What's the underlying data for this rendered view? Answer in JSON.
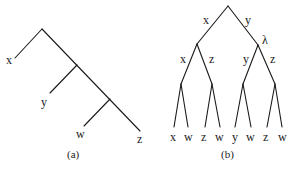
{
  "diagram_a": {
    "caption": "(a)",
    "leaves": [
      "x",
      "y",
      "w",
      "z"
    ],
    "structure": "caterpillar tree: x branches first, then y, then w and z"
  },
  "diagram_b": {
    "caption": "(b)",
    "root_edge_labels": [
      "x",
      "y"
    ],
    "right_node_label": "λ",
    "second_level_edge_labels": [
      "x",
      "z",
      "y",
      "z"
    ],
    "leaves": [
      "x",
      "w",
      "z",
      "w",
      "y",
      "w",
      "z",
      "w"
    ]
  }
}
